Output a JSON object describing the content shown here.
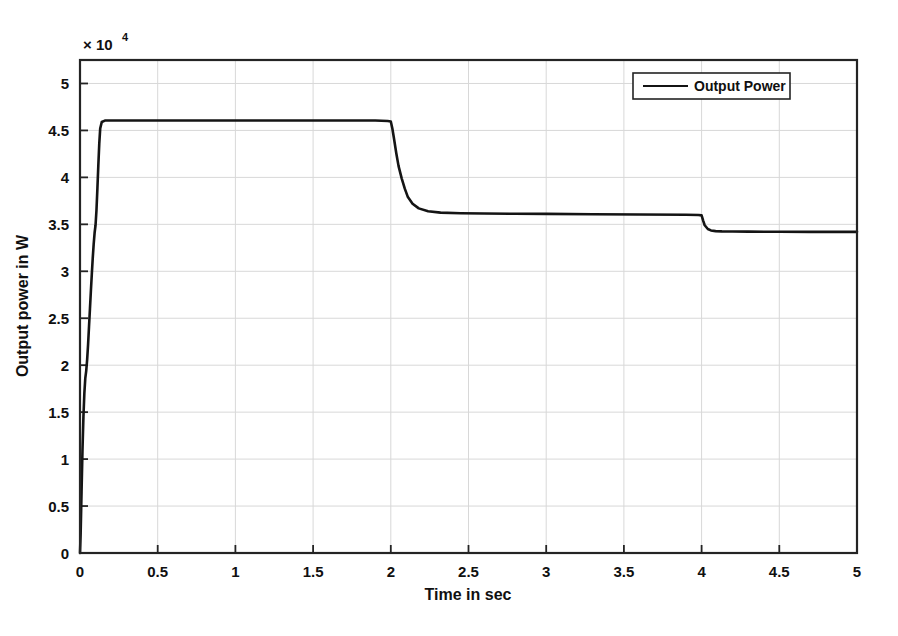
{
  "chart_data": {
    "type": "line",
    "title": "",
    "xlabel": "Time in sec",
    "ylabel": "Output power in W",
    "exponent_prefix": "× 10",
    "exponent_power": "4",
    "y_scale_factor": 10000,
    "xlim": [
      0,
      5
    ],
    "ylim": [
      0,
      5.25
    ],
    "grid": true,
    "legend_position": "top-right",
    "xticks": [
      0,
      0.5,
      1,
      1.5,
      2,
      2.5,
      3,
      3.5,
      4,
      4.5,
      5
    ],
    "xtick_labels": [
      "0",
      "0.5",
      "1",
      "1.5",
      "2",
      "2.5",
      "3",
      "3.5",
      "4",
      "4.5",
      "5"
    ],
    "yticks": [
      0,
      0.5,
      1,
      1.5,
      2,
      2.5,
      3,
      3.5,
      4,
      4.5,
      5
    ],
    "ytick_labels": [
      "0",
      "0.5",
      "1",
      "1.5",
      "2",
      "2.5",
      "3",
      "3.5",
      "4",
      "4.5",
      "5"
    ],
    "series": [
      {
        "name": "Output Power",
        "color": "#141414",
        "x": [
          0,
          0.004,
          0.01,
          0.016,
          0.022,
          0.028,
          0.034,
          0.04,
          0.046,
          0.052,
          0.058,
          0.064,
          0.07,
          0.076,
          0.082,
          0.088,
          0.094,
          0.1,
          0.106,
          0.112,
          0.118,
          0.124,
          0.13,
          0.14,
          0.16,
          0.2,
          0.3,
          0.5,
          0.8,
          1.2,
          1.6,
          1.9,
          1.98,
          2.0,
          2.01,
          2.02,
          2.035,
          2.05,
          2.07,
          2.09,
          2.11,
          2.14,
          2.18,
          2.24,
          2.32,
          2.45,
          2.6,
          2.8,
          3.0,
          3.3,
          3.6,
          3.9,
          3.98,
          4.0,
          4.01,
          4.02,
          4.04,
          4.06,
          4.09,
          4.13,
          4.2,
          4.3,
          4.5,
          4.7,
          4.9,
          5.0
        ],
        "y": [
          0,
          2000,
          6500,
          11000,
          14500,
          17000,
          18600,
          19400,
          20600,
          22200,
          24100,
          26000,
          27900,
          29700,
          31400,
          32900,
          34100,
          34900,
          36500,
          38800,
          41300,
          43600,
          45200,
          45900,
          46050,
          46050,
          46050,
          46050,
          46050,
          46050,
          46050,
          46050,
          46000,
          45950,
          45200,
          44200,
          42600,
          41200,
          39900,
          38800,
          37900,
          37200,
          36700,
          36400,
          36250,
          36180,
          36150,
          36130,
          36110,
          36080,
          36050,
          36020,
          36000,
          35950,
          35400,
          34900,
          34500,
          34350,
          34280,
          34250,
          34230,
          34220,
          34210,
          34200,
          34200,
          34200
        ]
      }
    ]
  },
  "legend": {
    "entries": [
      {
        "label": "Output Power"
      }
    ]
  }
}
